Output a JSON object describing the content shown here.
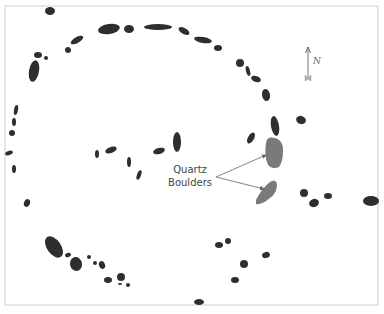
{
  "diagram": {
    "type": "stone-circle-site-plan",
    "frame": {
      "stroke": "#c8c8c8"
    },
    "colors": {
      "stone": "#2e2e2e",
      "quartz": "#7a7a7a",
      "arrow": "#666666",
      "text": "#444444"
    },
    "labels": {
      "quartz_line1": "Quartz",
      "quartz_line2": "Boulders",
      "north": "N"
    },
    "stones": [
      {
        "cx": 50,
        "cy": 11,
        "rx": 5,
        "ry": 4,
        "rot": 0
      },
      {
        "cx": 109,
        "cy": 29,
        "rx": 11,
        "ry": 5,
        "rot": -10
      },
      {
        "cx": 129,
        "cy": 29,
        "rx": 5,
        "ry": 4,
        "rot": 0
      },
      {
        "cx": 158,
        "cy": 27,
        "rx": 14,
        "ry": 3,
        "rot": 0
      },
      {
        "cx": 184,
        "cy": 31,
        "rx": 6,
        "ry": 3,
        "rot": 30
      },
      {
        "cx": 203,
        "cy": 40,
        "rx": 9,
        "ry": 3,
        "rot": 10
      },
      {
        "cx": 218,
        "cy": 48,
        "rx": 4,
        "ry": 3,
        "rot": 0
      },
      {
        "cx": 240,
        "cy": 63,
        "rx": 4,
        "ry": 4,
        "rot": 0
      },
      {
        "cx": 248,
        "cy": 71,
        "rx": 2,
        "ry": 5,
        "rot": -15
      },
      {
        "cx": 256,
        "cy": 79,
        "rx": 5,
        "ry": 3,
        "rot": 20
      },
      {
        "cx": 266,
        "cy": 95,
        "rx": 4,
        "ry": 6,
        "rot": -10
      },
      {
        "cx": 275,
        "cy": 126,
        "rx": 4,
        "ry": 10,
        "rot": -10
      },
      {
        "cx": 301,
        "cy": 120,
        "rx": 5,
        "ry": 4,
        "rot": 20
      },
      {
        "cx": 251,
        "cy": 138,
        "rx": 3,
        "ry": 6,
        "rot": 30
      },
      {
        "cx": 77,
        "cy": 40,
        "rx": 7,
        "ry": 3,
        "rot": -30
      },
      {
        "cx": 68,
        "cy": 50,
        "rx": 3,
        "ry": 3,
        "rot": -20
      },
      {
        "cx": 38,
        "cy": 55,
        "rx": 4,
        "ry": 3,
        "rot": 0
      },
      {
        "cx": 46,
        "cy": 58,
        "rx": 2,
        "ry": 2,
        "rot": 0
      },
      {
        "cx": 34,
        "cy": 71,
        "rx": 5,
        "ry": 11,
        "rot": 10
      },
      {
        "cx": 16,
        "cy": 110,
        "rx": 2,
        "ry": 5,
        "rot": 10
      },
      {
        "cx": 14,
        "cy": 122,
        "rx": 2,
        "ry": 4,
        "rot": 0
      },
      {
        "cx": 12,
        "cy": 133,
        "rx": 3,
        "ry": 3,
        "rot": 0
      },
      {
        "cx": 9,
        "cy": 153,
        "rx": 4,
        "ry": 2,
        "rot": -20
      },
      {
        "cx": 14,
        "cy": 169,
        "rx": 2,
        "ry": 4,
        "rot": 0
      },
      {
        "cx": 27,
        "cy": 203,
        "rx": 3,
        "ry": 4,
        "rot": 20
      },
      {
        "cx": 177,
        "cy": 142,
        "rx": 4,
        "ry": 10,
        "rot": 0
      },
      {
        "cx": 159,
        "cy": 151,
        "rx": 6,
        "ry": 3,
        "rot": -15
      },
      {
        "cx": 97,
        "cy": 154,
        "rx": 2,
        "ry": 4,
        "rot": 0
      },
      {
        "cx": 111,
        "cy": 150,
        "rx": 6,
        "ry": 3,
        "rot": -20
      },
      {
        "cx": 129,
        "cy": 162,
        "rx": 2,
        "ry": 5,
        "rot": 0
      },
      {
        "cx": 139,
        "cy": 175,
        "rx": 2,
        "ry": 5,
        "rot": 20
      },
      {
        "cx": 54,
        "cy": 247,
        "rx": 7,
        "ry": 12,
        "rot": -35
      },
      {
        "cx": 68,
        "cy": 255,
        "rx": 3,
        "ry": 2,
        "rot": -20
      },
      {
        "cx": 76,
        "cy": 264,
        "rx": 6,
        "ry": 7,
        "rot": -10
      },
      {
        "cx": 89,
        "cy": 257,
        "rx": 2,
        "ry": 2,
        "rot": 0
      },
      {
        "cx": 95,
        "cy": 263,
        "rx": 2,
        "ry": 2,
        "rot": 0
      },
      {
        "cx": 102,
        "cy": 265,
        "rx": 3,
        "ry": 4,
        "rot": -20
      },
      {
        "cx": 108,
        "cy": 280,
        "rx": 4,
        "ry": 3,
        "rot": 0
      },
      {
        "cx": 121,
        "cy": 277,
        "rx": 4,
        "ry": 4,
        "rot": 0
      },
      {
        "cx": 120,
        "cy": 284,
        "rx": 2,
        "ry": 1,
        "rot": 0
      },
      {
        "cx": 128,
        "cy": 285,
        "rx": 2,
        "ry": 2,
        "rot": 0
      },
      {
        "cx": 304,
        "cy": 193,
        "rx": 4,
        "ry": 4,
        "rot": 0
      },
      {
        "cx": 314,
        "cy": 203,
        "rx": 5,
        "ry": 4,
        "rot": -20
      },
      {
        "cx": 328,
        "cy": 196,
        "rx": 4,
        "ry": 3,
        "rot": 0
      },
      {
        "cx": 371,
        "cy": 201,
        "rx": 8,
        "ry": 5,
        "rot": 0
      },
      {
        "cx": 219,
        "cy": 245,
        "rx": 4,
        "ry": 3,
        "rot": 0
      },
      {
        "cx": 228,
        "cy": 241,
        "rx": 3,
        "ry": 3,
        "rot": 0
      },
      {
        "cx": 266,
        "cy": 255,
        "rx": 4,
        "ry": 3,
        "rot": -20
      },
      {
        "cx": 244,
        "cy": 264,
        "rx": 4,
        "ry": 4,
        "rot": 0
      },
      {
        "cx": 235,
        "cy": 280,
        "rx": 4,
        "ry": 3,
        "rot": 0
      },
      {
        "cx": 199,
        "cy": 302,
        "rx": 5,
        "ry": 3,
        "rot": 0
      }
    ],
    "quartz_boulders": [
      {
        "path": "M266,143 Q267,136 275,138 Q283,140 283,150 Q283,162 279,167 Q272,170 268,165 Q264,156 266,143 Z"
      },
      {
        "path": "M256,200 Q262,188 270,182 Q277,178 277,186 Q276,194 270,198 Q262,205 256,204 Z"
      }
    ],
    "callout": {
      "origin": {
        "x": 216,
        "y": 177
      },
      "targets": [
        {
          "x": 266,
          "y": 155
        },
        {
          "x": 264,
          "y": 189
        }
      ]
    },
    "north_arrow": {
      "x": 308,
      "tip_y": 47,
      "tail_y": 81
    }
  }
}
